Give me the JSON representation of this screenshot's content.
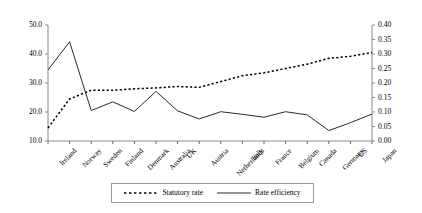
{
  "chart_data": {
    "type": "line",
    "title": "",
    "xlabel": "",
    "ylabel": "",
    "y2label": "",
    "grid": false,
    "legend_position": "bottom",
    "categories": [
      "Ireland",
      "Norway",
      "Sweden",
      "Finland",
      "Denmark",
      "Australia",
      "UK",
      "Austria",
      "Netherlands",
      "Italy",
      "France",
      "Belgium",
      "Canada",
      "Germany",
      "US",
      "Japan"
    ],
    "ylim": [
      10.0,
      50.0
    ],
    "y_ticks": [
      "10.0",
      "20.0",
      "30.0",
      "40.0",
      "50.0"
    ],
    "y2lim": [
      0.0,
      0.4
    ],
    "y2_ticks": [
      "0.00",
      "0.05",
      "0.10",
      "0.15",
      "0.20",
      "0.25",
      "0.30",
      "0.35",
      "0.40"
    ],
    "series": [
      {
        "name": "Statutory rate",
        "axis": "right",
        "style": "dotted",
        "color": "#000000",
        "values": [
          0.045,
          0.145,
          0.175,
          0.175,
          0.18,
          0.183,
          0.188,
          0.185,
          0.205,
          0.225,
          0.235,
          0.25,
          0.265,
          0.285,
          0.292,
          0.305
        ]
      },
      {
        "name": "Rate efficiency",
        "axis": "left",
        "style": "solid",
        "color": "#000000",
        "values": [
          34.5,
          44.2,
          20.5,
          23.5,
          20.2,
          27.1,
          20.4,
          17.6,
          20.1,
          19.2,
          18.2,
          20.1,
          19.0,
          13.6,
          16.3,
          19.3
        ]
      }
    ]
  },
  "legend": {
    "entries": [
      {
        "label": "Statutory rate",
        "style": "dotted"
      },
      {
        "label": "Rate efficiency",
        "style": "solid"
      }
    ]
  }
}
